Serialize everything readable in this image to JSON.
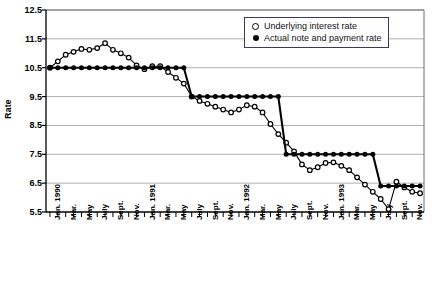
{
  "chart_data": {
    "type": "line",
    "title": "",
    "xlabel": "",
    "ylabel": "Rate",
    "ylim": [
      5.5,
      12.5
    ],
    "yticks": [
      5.5,
      6.5,
      7.5,
      8.5,
      9.5,
      10.5,
      11.5,
      12.5
    ],
    "grid": true,
    "legend_position": "top-right",
    "x": [
      "Jan. 1990",
      "Feb.",
      "Mar.",
      "Apr.",
      "May",
      "June",
      "July",
      "Aug.",
      "Sept.",
      "Oct.",
      "Nov.",
      "Dec.",
      "Jan. 1991",
      "Feb.",
      "Mar.",
      "Apr.",
      "May",
      "June",
      "July",
      "Aug.",
      "Sept.",
      "Oct.",
      "Nov.",
      "Dec.",
      "Jan. 1992",
      "Feb.",
      "Mar.",
      "Apr.",
      "May",
      "June",
      "July",
      "Aug.",
      "Sept.",
      "Oct.",
      "Nov.",
      "Dec.",
      "Jan. 1993",
      "Feb.",
      "Mar.",
      "Apr.",
      "May",
      "June",
      "July",
      "Aug.",
      "Sept.",
      "Oct.",
      "Nov.",
      "Dec."
    ],
    "xtick_labels": [
      "Jan. 1990",
      "Mar.",
      "May",
      "July",
      "Sept.",
      "Nov.",
      "Jan. 1991",
      "Mar.",
      "May",
      "July",
      "Sept.",
      "Nov.",
      "Jan. 1992",
      "Mar.",
      "May",
      "July",
      "Sept.",
      "Nov.",
      "Jan. 1993",
      "Mar.",
      "May",
      "July",
      "Sept.",
      "Nov."
    ],
    "xtick_indices": [
      0,
      2,
      4,
      6,
      8,
      10,
      12,
      14,
      16,
      18,
      20,
      22,
      24,
      26,
      28,
      30,
      32,
      34,
      36,
      38,
      40,
      42,
      44,
      46
    ],
    "series": [
      {
        "name": "Underlying interest rate",
        "marker": "open-circle",
        "color": "#000000",
        "values": [
          10.5,
          10.72,
          10.95,
          11.05,
          11.15,
          11.12,
          11.18,
          11.35,
          11.12,
          11.0,
          10.85,
          10.58,
          10.45,
          10.55,
          10.55,
          10.35,
          10.15,
          9.95,
          9.5,
          9.35,
          9.25,
          9.15,
          9.05,
          8.95,
          9.05,
          9.2,
          9.15,
          8.95,
          8.55,
          8.2,
          7.9,
          7.6,
          7.15,
          6.95,
          7.05,
          7.2,
          7.22,
          7.1,
          6.95,
          6.7,
          6.45,
          6.2,
          5.95,
          5.6,
          6.55,
          6.35,
          6.2,
          6.15
        ]
      },
      {
        "name": "Actual note and payment rate",
        "marker": "filled-circle",
        "color": "#000000",
        "values": [
          10.5,
          10.5,
          10.5,
          10.5,
          10.5,
          10.5,
          10.5,
          10.5,
          10.5,
          10.5,
          10.5,
          10.5,
          10.5,
          10.5,
          10.5,
          10.5,
          10.5,
          10.5,
          9.5,
          9.5,
          9.5,
          9.5,
          9.5,
          9.5,
          9.5,
          9.5,
          9.5,
          9.5,
          9.5,
          9.5,
          7.5,
          7.5,
          7.5,
          7.5,
          7.5,
          7.5,
          7.5,
          7.5,
          7.5,
          7.5,
          7.5,
          7.5,
          6.4,
          6.4,
          6.4,
          6.4,
          6.4,
          6.4
        ]
      }
    ]
  },
  "legend": {
    "entries": [
      {
        "label": "Underlying interest rate",
        "marker": "open-circle"
      },
      {
        "label": "Actual note and payment rate",
        "marker": "filled-circle"
      }
    ]
  }
}
